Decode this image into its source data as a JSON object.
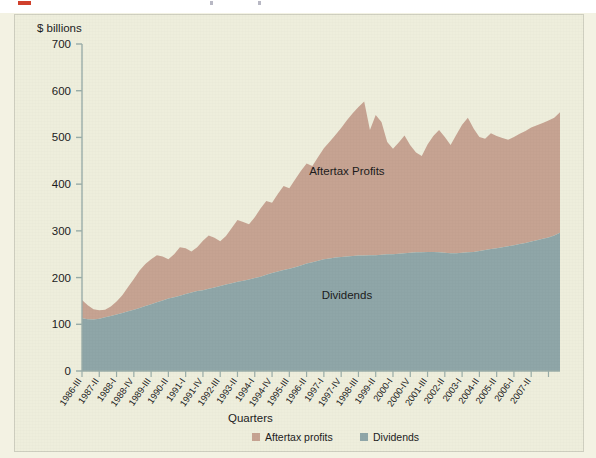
{
  "figure": {
    "background_color": "#eeeedc",
    "frame_border_color": "#cfcfc0",
    "axis_color": "#9aada8"
  },
  "chart_data": {
    "type": "area",
    "stacked": true,
    "title": "",
    "subtitle": "",
    "unit_label": "$ billions",
    "xlabel": "Quarters",
    "ylabel": "",
    "ylim": [
      0,
      700
    ],
    "yticks": [
      0,
      100,
      200,
      300,
      400,
      500,
      600,
      700
    ],
    "ytick_labels": [
      "0",
      "100",
      "200",
      "300",
      "400",
      "500",
      "600",
      "700"
    ],
    "grid": false,
    "legend_position": "bottom-center",
    "inline_labels": [
      {
        "text": "Aftertax Profits",
        "x_index": 46,
        "value": 420
      },
      {
        "text": "Dividends",
        "x_index": 46,
        "value": 155
      }
    ],
    "xtick_labels": [
      "1986-III",
      "1987-II",
      "1988-I",
      "1988-IV",
      "1989-III",
      "1990-II",
      "1991-I",
      "1991-IV",
      "1992-III",
      "1993-II",
      "1994-I",
      "1994-IV",
      "1995-III",
      "1996-II",
      "1997-I",
      "1997-IV",
      "1998-III",
      "1999-II",
      "2000-I",
      "2000-IV",
      "2001-III",
      "2002-II",
      "2003-I",
      "2004-II",
      "2005-II",
      "2006-I",
      "2007-II"
    ],
    "xtick_indices": [
      0,
      3,
      6,
      9,
      12,
      15,
      18,
      21,
      24,
      27,
      30,
      33,
      36,
      39,
      42,
      45,
      48,
      51,
      54,
      57,
      60,
      63,
      66,
      69,
      72,
      75,
      78
    ],
    "x_count": 84,
    "series": [
      {
        "name": "Dividends",
        "color": "#8fa6a8",
        "values": [
          113,
          111,
          110,
          112,
          115,
          118,
          121,
          124,
          128,
          131,
          135,
          139,
          143,
          147,
          151,
          155,
          158,
          161,
          165,
          168,
          171,
          173,
          176,
          179,
          182,
          185,
          188,
          191,
          193,
          196,
          199,
          202,
          206,
          210,
          213,
          216,
          219,
          222,
          226,
          230,
          233,
          236,
          239,
          241,
          243,
          244,
          245,
          246,
          247,
          247,
          248,
          248,
          249,
          250,
          250,
          251,
          252,
          253,
          254,
          254,
          255,
          255,
          254,
          253,
          252,
          252,
          253,
          254,
          255,
          257,
          259,
          261,
          263,
          265,
          267,
          269,
          272,
          274,
          277,
          280,
          283,
          286,
          290,
          296
        ]
      },
      {
        "name": "Aftertax profits",
        "color": "#c6a392",
        "values": [
          39,
          30,
          22,
          18,
          16,
          20,
          28,
          38,
          52,
          66,
          80,
          90,
          96,
          101,
          94,
          84,
          92,
          104,
          98,
          88,
          94,
          106,
          114,
          106,
          96,
          104,
          118,
          132,
          126,
          118,
          130,
          146,
          158,
          150,
          166,
          180,
          172,
          188,
          202,
          214,
          206,
          222,
          238,
          250,
          262,
          276,
          292,
          306,
          318,
          330,
          268,
          300,
          284,
          240,
          226,
          238,
          252,
          230,
          214,
          206,
          230,
          248,
          262,
          248,
          232,
          254,
          274,
          288,
          264,
          244,
          238,
          248,
          240,
          234,
          228,
          232,
          236,
          240,
          244,
          246,
          248,
          250,
          252,
          258
        ]
      }
    ],
    "totals_note": "Total = Dividends + Aftertax profits (stacked)"
  },
  "legend": {
    "items": [
      {
        "label": "Aftertax profits",
        "color": "#c6a392"
      },
      {
        "label": "Dividends",
        "color": "#8fa6a8"
      }
    ]
  }
}
